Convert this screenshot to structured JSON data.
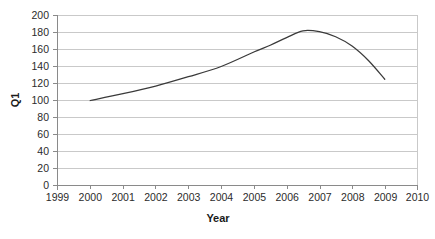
{
  "chart_data": {
    "type": "line",
    "title": "",
    "xlabel": "Year",
    "ylabel": "Q1",
    "xlim": [
      1999,
      2010
    ],
    "ylim": [
      0,
      200
    ],
    "grid": true,
    "legend": "none",
    "x_ticks": [
      "1999",
      "2000",
      "2001",
      "2002",
      "2003",
      "2004",
      "2005",
      "2006",
      "2007",
      "2008",
      "2009",
      "2010"
    ],
    "y_ticks": [
      "0",
      "20",
      "40",
      "60",
      "80",
      "100",
      "120",
      "140",
      "160",
      "180",
      "200"
    ],
    "series": [
      {
        "name": "Q1",
        "color": "#3a3a3a",
        "x": [
          2000,
          2001,
          2002,
          2003,
          2004,
          2005,
          2005.5,
          2006,
          2006.5,
          2007,
          2007.5,
          2008,
          2008.5,
          2009
        ],
        "values": [
          100,
          108,
          117,
          128,
          140,
          157,
          165,
          174,
          182,
          181,
          175,
          164,
          147,
          125
        ]
      }
    ]
  },
  "axes": {
    "y_label": "Q1",
    "x_label": "Year"
  }
}
